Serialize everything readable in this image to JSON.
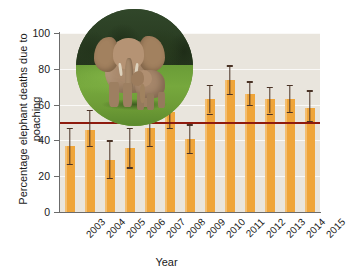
{
  "chart_data": {
    "type": "bar",
    "title": "",
    "subtitle": "",
    "xlabel": "Year",
    "ylabel": "Percentage elephant deaths due to poaching",
    "categories": [
      "2003",
      "2004",
      "2005",
      "2006",
      "2007",
      "2008",
      "2009",
      "2010",
      "2011",
      "2012",
      "2013",
      "2014",
      "2015"
    ],
    "values": [
      37,
      46,
      29,
      36,
      47,
      56,
      41,
      63,
      74,
      66,
      63,
      63,
      58
    ],
    "error_low": [
      27,
      37,
      19,
      25,
      37,
      47,
      33,
      55,
      66,
      60,
      55,
      56,
      51
    ],
    "error_high": [
      47,
      57,
      40,
      47,
      57,
      65,
      49,
      71,
      82,
      73,
      70,
      71,
      68
    ],
    "ylim": [
      0,
      100
    ],
    "yticks": [
      0,
      20,
      40,
      60,
      80,
      100
    ],
    "ytick_labels": [
      "0",
      "20",
      "40",
      "60",
      "80",
      "100"
    ],
    "grid": true,
    "legend": "none",
    "reference_line": {
      "value": 50,
      "color": "#8e1b0e",
      "label": ""
    },
    "bar_color": "#efa53a",
    "error_color": "#4a3326",
    "plot_background": "#e9e5dd",
    "xtick_rotation": -45
  },
  "figure": {
    "photo_inset": {
      "name": "elephant-photo",
      "description": "African elephant adult with calf on grassland"
    }
  }
}
